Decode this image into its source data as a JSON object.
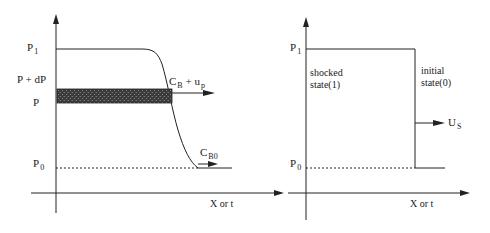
{
  "left_panel": {
    "labels": {
      "p1": {
        "main": "P",
        "sub": "1"
      },
      "p_dp": "P + dP",
      "p": "P",
      "p0": {
        "main": "P",
        "sub": "0"
      },
      "cb_up": {
        "main": "C",
        "sub": "B",
        "rest": " + u",
        "sub2": "p"
      },
      "cb0": {
        "main": "C",
        "sub": "B0"
      },
      "xaxis": "X or t"
    }
  },
  "right_panel": {
    "labels": {
      "p1": {
        "main": "P",
        "sub": "1"
      },
      "p0": {
        "main": "P",
        "sub": "0"
      },
      "shocked_line1": "shocked",
      "shocked_line2": "state(1)",
      "initial_line1": "initial",
      "initial_line2": "state(0)",
      "us": {
        "main": "U",
        "sub": "S"
      },
      "xaxis": "X or t"
    }
  },
  "colors": {
    "ink": "#222222",
    "band": "#3a3a3a",
    "background": "#ffffff"
  }
}
